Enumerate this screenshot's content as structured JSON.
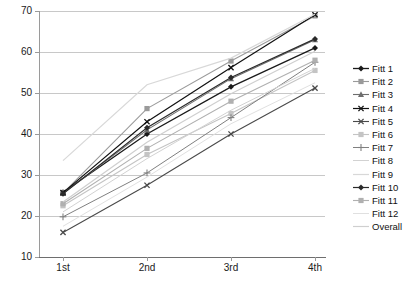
{
  "chart_data": {
    "type": "line",
    "title": "",
    "xlabel": "",
    "ylabel": "",
    "categories": [
      "1st",
      "2nd",
      "3rd",
      "4th"
    ],
    "x_tick_labels": [
      "1st",
      "2nd",
      "3rd",
      "4th"
    ],
    "y_tick_labels": [
      "70",
      "60",
      "50",
      "40",
      "30",
      "20",
      "10"
    ],
    "ylim": [
      10,
      70
    ],
    "ytick_step": 10,
    "grid": "horizontal",
    "legend_position": "right",
    "series": [
      {
        "name": "Fitt 1",
        "values": [
          25.8,
          40.0,
          51.5,
          61.0
        ],
        "color": "#1a1a1a",
        "marker": "diamond",
        "width": 1.3
      },
      {
        "name": "Fitt 2",
        "values": [
          25.6,
          46.2,
          57.8,
          68.8
        ],
        "color": "#9a9a9a",
        "marker": "square",
        "width": 1.1
      },
      {
        "name": "Fitt 3",
        "values": [
          25.5,
          41.0,
          53.5,
          63.0
        ],
        "color": "#6e6e6e",
        "marker": "triangle",
        "width": 1.1
      },
      {
        "name": "Fitt 4",
        "values": [
          25.7,
          43.0,
          56.2,
          69.1
        ],
        "color": "#111111",
        "marker": "cross",
        "width": 1.2
      },
      {
        "name": "Fitt 5",
        "values": [
          16.0,
          27.5,
          40.0,
          51.2
        ],
        "color": "#4a4a4a",
        "marker": "cross",
        "width": 1.1
      },
      {
        "name": "Fitt 6",
        "values": [
          22.5,
          35.0,
          45.0,
          55.5
        ],
        "color": "#c4c4c4",
        "marker": "square",
        "width": 1.1
      },
      {
        "name": "Fitt 7",
        "values": [
          19.8,
          30.5,
          44.0,
          57.5
        ],
        "color": "#808080",
        "marker": "plus",
        "width": 1.0
      },
      {
        "name": "Fitt 8",
        "values": [
          21.0,
          34.0,
          45.8,
          56.0
        ],
        "color": "#d2d2d2",
        "marker": "none",
        "width": 1.0
      },
      {
        "name": "Fitt 9",
        "values": [
          33.5,
          52.0,
          58.5,
          69.2
        ],
        "color": "#d8d8d8",
        "marker": "none",
        "width": 1.2
      },
      {
        "name": "Fitt 10",
        "values": [
          25.4,
          41.5,
          53.8,
          63.2
        ],
        "color": "#2a2a2a",
        "marker": "diamond",
        "width": 1.2
      },
      {
        "name": "Fitt 11",
        "values": [
          23.0,
          36.5,
          48.0,
          58.0
        ],
        "color": "#b0b0b0",
        "marker": "square",
        "width": 1.1
      },
      {
        "name": "Fitt 12",
        "values": [
          17.5,
          29.5,
          42.5,
          52.5
        ],
        "color": "#e0e0e0",
        "marker": "none",
        "width": 1.0
      },
      {
        "name": "Overall",
        "values": [
          23.4,
          38.0,
          49.8,
          60.2
        ],
        "color": "#cfcfcf",
        "marker": "none",
        "width": 1.2
      }
    ]
  },
  "legend": {
    "items": [
      {
        "label": "Fitt 1"
      },
      {
        "label": "Fitt 2"
      },
      {
        "label": "Fitt 3"
      },
      {
        "label": "Fitt 4"
      },
      {
        "label": "Fitt 5"
      },
      {
        "label": "Fitt 6"
      },
      {
        "label": "Fitt 7"
      },
      {
        "label": "Fitt 8"
      },
      {
        "label": "Fitt 9"
      },
      {
        "label": "Fitt 10"
      },
      {
        "label": "Fitt 11"
      },
      {
        "label": "Fitt 12"
      },
      {
        "label": "Overall"
      }
    ]
  }
}
